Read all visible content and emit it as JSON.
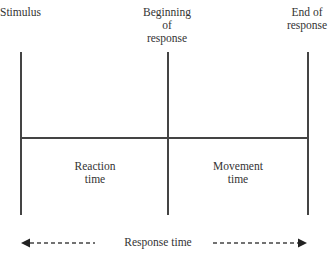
{
  "labels": {
    "stimulus": "Stimulus",
    "beginning_of_response": [
      "Beginning",
      "of",
      "response"
    ],
    "end_of_response": [
      "End of",
      "response"
    ],
    "reaction_time": [
      "Reaction",
      "time"
    ],
    "movement_time": [
      "Movement",
      "time"
    ],
    "response_time": "Response time"
  },
  "colors": {
    "line": "#444444",
    "text": "#333333"
  }
}
